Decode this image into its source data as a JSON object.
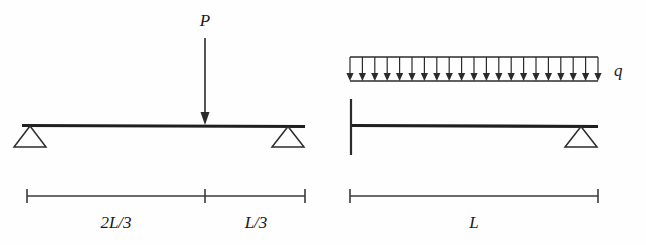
{
  "figure": {
    "background_color": "#fefefe",
    "ink_color": "#262626",
    "panels": [
      {
        "id": "left-panel",
        "name": "simply-supported-beam-point-load",
        "beam": {
          "x_start": 22,
          "x_end": 305,
          "y": 126,
          "left_support": "pin-triangle",
          "right_support": "pin-triangle"
        },
        "load": {
          "type": "point-load",
          "label": "P",
          "label_x": 205,
          "label_y": 22,
          "arrow_x": 205,
          "arrow_top_y": 38,
          "arrow_tip_y": 124
        },
        "dimension": {
          "y": 196,
          "x_start": 27,
          "x_end": 305,
          "x_mid_tick": 205,
          "segments": [
            {
              "label": "2L/3",
              "center_x": 116,
              "label_y": 228
            },
            {
              "label": "L/3",
              "center_x": 256,
              "label_y": 228
            }
          ]
        }
      },
      {
        "id": "right-panel",
        "name": "propped-cantilever-beam-uniform-load",
        "beam": {
          "x_start": 350,
          "x_end": 598,
          "y": 126,
          "left_support": "wall-vertical-line",
          "right_support": "pin-triangle"
        },
        "load": {
          "type": "uniformly-distributed-load",
          "label": "q",
          "label_x": 614,
          "label_y": 76,
          "x_start": 350,
          "x_end": 598,
          "top_y": 57,
          "tip_y": 81,
          "arrow_count": 21
        },
        "dimension": {
          "y": 196,
          "x_start": 350,
          "x_end": 598,
          "segments": [
            {
              "label": "L",
              "center_x": 474,
              "label_y": 228
            }
          ]
        }
      }
    ]
  }
}
